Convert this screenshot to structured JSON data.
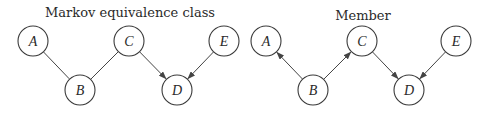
{
  "diagrams": [
    {
      "id": "left",
      "title": "Markov equivalence class",
      "title_pos": [
        130,
        17
      ],
      "nodes": [
        {
          "id": "A",
          "label": "A",
          "x": 33,
          "y": 41
        },
        {
          "id": "B",
          "label": "B",
          "x": 80,
          "y": 90
        },
        {
          "id": "C",
          "label": "C",
          "x": 129,
          "y": 41
        },
        {
          "id": "D",
          "label": "D",
          "x": 177,
          "y": 90
        },
        {
          "id": "E",
          "label": "E",
          "x": 224,
          "y": 41
        }
      ],
      "edges": [
        {
          "from": "A",
          "to": "B",
          "directed": false
        },
        {
          "from": "C",
          "to": "B",
          "directed": false
        },
        {
          "from": "C",
          "to": "D",
          "directed": true
        },
        {
          "from": "E",
          "to": "D",
          "directed": true
        }
      ]
    },
    {
      "id": "right",
      "title": "Member",
      "title_pos": [
        363,
        20
      ],
      "nodes": [
        {
          "id": "A",
          "label": "A",
          "x": 266,
          "y": 41
        },
        {
          "id": "B",
          "label": "B",
          "x": 313,
          "y": 90
        },
        {
          "id": "C",
          "label": "C",
          "x": 362,
          "y": 41
        },
        {
          "id": "D",
          "label": "D",
          "x": 409,
          "y": 90
        },
        {
          "id": "E",
          "label": "E",
          "x": 456,
          "y": 41
        }
      ],
      "edges": [
        {
          "from": "B",
          "to": "A",
          "directed": true
        },
        {
          "from": "B",
          "to": "C",
          "directed": true
        },
        {
          "from": "C",
          "to": "D",
          "directed": true
        },
        {
          "from": "E",
          "to": "D",
          "directed": true
        }
      ]
    }
  ],
  "style": {
    "node_radius": 15,
    "stroke_color": "#3a3a3a",
    "edge_color": "#444444"
  }
}
